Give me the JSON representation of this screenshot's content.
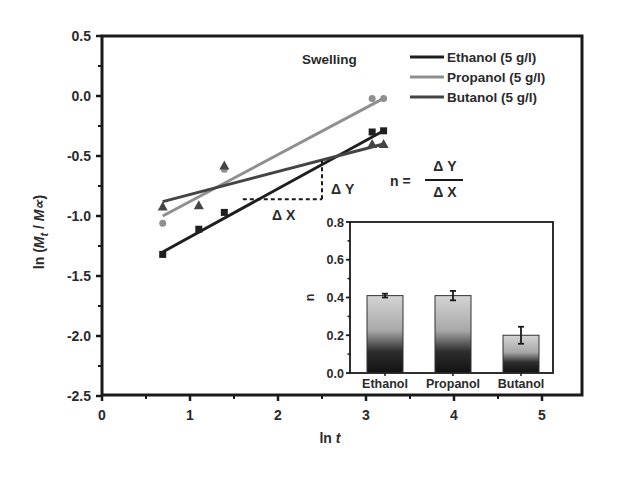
{
  "chart_data": [
    {
      "type": "scatter",
      "title": "",
      "annotation": "Swelling",
      "xlabel": "ln t",
      "ylabel": "ln (Mt / M∝)",
      "xlim": [
        0,
        5.45
      ],
      "ylim": [
        -2.5,
        0.5
      ],
      "x_ticks": [
        "0",
        "1",
        "2",
        "3",
        "4",
        "5"
      ],
      "y_ticks": [
        "0.5",
        "0.0",
        "-0.5",
        "-1.0",
        "-1.5",
        "-2.0",
        "-2.5"
      ],
      "grid": false,
      "legend_position": "top-right",
      "series": [
        {
          "name": "Ethanol (5 g/l)",
          "marker": "square",
          "color": "#1e1e1e",
          "x": [
            0.69,
            1.1,
            1.39,
            3.07,
            3.2
          ],
          "y": [
            -1.32,
            -1.11,
            -0.97,
            -0.3,
            -0.29
          ],
          "fit": {
            "x": [
              0.69,
              3.2
            ],
            "y": [
              -1.3,
              -0.29
            ]
          }
        },
        {
          "name": "Propanol (5 g/l)",
          "marker": "circle",
          "color": "#8f8f8f",
          "x": [
            0.69,
            1.39,
            3.07,
            3.2
          ],
          "y": [
            -1.06,
            -0.61,
            -0.02,
            -0.02
          ],
          "fit": {
            "x": [
              0.69,
              3.2
            ],
            "y": [
              -1.0,
              -0.02
            ]
          }
        },
        {
          "name": "Butanol (5 g/l)",
          "marker": "triangle",
          "color": "#444444",
          "x": [
            0.69,
            1.1,
            1.39,
            3.07,
            3.2
          ],
          "y": [
            -0.92,
            -0.91,
            -0.58,
            -0.4,
            -0.4
          ],
          "fit": {
            "x": [
              0.69,
              3.2
            ],
            "y": [
              -0.88,
              -0.4
            ]
          }
        }
      ],
      "slope_annotation": {
        "dx_label": "Δ X",
        "dy_label": "Δ Y",
        "formula_lhs": "n =",
        "formula_num": "Δ Y",
        "formula_den": "Δ X",
        "triangle": {
          "x0": 1.6,
          "x1": 2.5,
          "y0": -0.86,
          "y1": -0.54
        }
      }
    },
    {
      "type": "bar",
      "title": "",
      "inset": true,
      "xlabel": "",
      "ylabel": "n",
      "categories": [
        "Ethanol",
        "Propanol",
        "Butanol"
      ],
      "values": [
        0.41,
        0.41,
        0.2
      ],
      "errors": [
        0.01,
        0.025,
        0.045
      ],
      "ylim": [
        0,
        0.8
      ],
      "y_ticks": [
        "0.8",
        "0.6",
        "0.4",
        "0.2",
        "0.0"
      ],
      "grid": false
    }
  ]
}
